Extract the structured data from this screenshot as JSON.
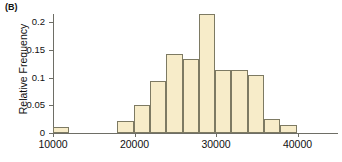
{
  "panel": {
    "label": "(B)"
  },
  "chart_data": {
    "type": "bar",
    "title": "",
    "subtitle": "",
    "xlabel": "",
    "ylabel": "Relative Frequency",
    "grid": false,
    "legend": null,
    "xlim": [
      10000,
      44000
    ],
    "ylim": [
      0,
      0.225
    ],
    "bin_width": 2000,
    "x_tick_labels": [
      "10000",
      "20000",
      "30000",
      "40000"
    ],
    "x_tick_values": [
      10000,
      20000,
      30000,
      40000
    ],
    "y_tick_labels": [
      "0",
      "0.05",
      "0.1",
      "0.15",
      "0.2"
    ],
    "y_tick_values": [
      0,
      0.05,
      0.1,
      0.15,
      0.2
    ],
    "bin_edges": [
      10000,
      12000,
      14000,
      16000,
      18000,
      20000,
      22000,
      24000,
      26000,
      28000,
      30000,
      32000,
      34000,
      36000,
      38000,
      40000,
      42000,
      44000
    ],
    "categories": [
      "10000-12000",
      "12000-14000",
      "14000-16000",
      "16000-18000",
      "18000-20000",
      "20000-22000",
      "22000-24000",
      "24000-26000",
      "26000-28000",
      "28000-30000",
      "30000-32000",
      "32000-34000",
      "34000-36000",
      "36000-38000",
      "38000-40000",
      "40000-42000",
      "42000-44000"
    ],
    "values": [
      0.01,
      0.0,
      0.0,
      0.0,
      0.021,
      0.051,
      0.093,
      0.142,
      0.133,
      0.214,
      0.113,
      0.113,
      0.104,
      0.025,
      0.015,
      0.0,
      0.0
    ],
    "bars": [
      {
        "x0": 10000,
        "x1": 12000,
        "value": 0.01
      },
      {
        "x0": 17800,
        "x1": 19900,
        "value": 0.021
      },
      {
        "x0": 19900,
        "x1": 21900,
        "value": 0.051
      },
      {
        "x0": 21900,
        "x1": 23900,
        "value": 0.093
      },
      {
        "x0": 23900,
        "x1": 25900,
        "value": 0.142
      },
      {
        "x0": 25900,
        "x1": 27900,
        "value": 0.133
      },
      {
        "x0": 27900,
        "x1": 29900,
        "value": 0.214
      },
      {
        "x0": 29900,
        "x1": 31900,
        "value": 0.113
      },
      {
        "x0": 31900,
        "x1": 33900,
        "value": 0.113
      },
      {
        "x0": 33900,
        "x1": 35900,
        "value": 0.104
      },
      {
        "x0": 35900,
        "x1": 37900,
        "value": 0.025
      },
      {
        "x0": 37900,
        "x1": 40000,
        "value": 0.015
      }
    ],
    "colors": {
      "bar_fill": "#f7ecc9",
      "bar_stroke": "#7d7a63",
      "axis": "#6e6e66",
      "text": "#111111",
      "background": "#ffffff"
    }
  }
}
